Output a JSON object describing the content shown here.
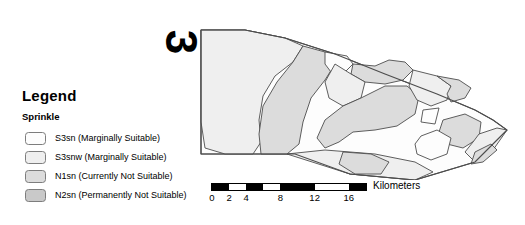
{
  "legend": {
    "title": "Legend",
    "subtitle": "Sprinkle",
    "items": [
      {
        "label": "S3sn (Marginally Suitable)",
        "color": "#fdfdfd"
      },
      {
        "label": "S3snw (Marginally Suitable)",
        "color": "#efefef"
      },
      {
        "label": "N1sn (Currently Not Suitable)",
        "color": "#dcdcdc"
      },
      {
        "label": "N2sn (Permanently Not Suitable)",
        "color": "#c9c9c9"
      }
    ]
  },
  "map": {
    "index_label": "3",
    "outline_color": "#4d4d4d",
    "fills": {
      "s3sn": "#fdfdfd",
      "s3snw": "#efefef",
      "n1sn": "#dcdcdc",
      "n2sn": "#c9c9c9"
    }
  },
  "scalebar": {
    "unit": "Kilometers",
    "tick_labels": [
      "0",
      "2",
      "4",
      "8",
      "12",
      "16"
    ],
    "tick_values": [
      0,
      2,
      4,
      8,
      12,
      16
    ],
    "min": 0,
    "max": 18,
    "segments": [
      {
        "from": 0,
        "to": 2,
        "fill": "black"
      },
      {
        "from": 2,
        "to": 4,
        "fill": "white"
      },
      {
        "from": 4,
        "to": 6,
        "fill": "black"
      },
      {
        "from": 6,
        "to": 8,
        "fill": "white"
      },
      {
        "from": 8,
        "to": 12,
        "fill": "black"
      },
      {
        "from": 12,
        "to": 16,
        "fill": "white"
      },
      {
        "from": 16,
        "to": 18,
        "fill": "black"
      }
    ]
  }
}
